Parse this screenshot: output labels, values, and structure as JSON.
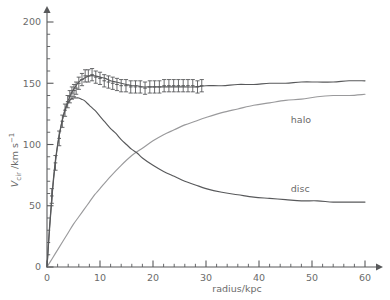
{
  "chart_data": {
    "type": "line",
    "title": "",
    "subtitle": "",
    "xlabel": "radius/kpc",
    "ylabel": "V_cir /km s^-1",
    "ylabel_parts": {
      "main": "V",
      "sub": "cir",
      "unit": " /km s",
      "sup": "−1"
    },
    "xlim": [
      0,
      62
    ],
    "ylim": [
      0,
      212
    ],
    "grid": false,
    "legend_position": "inline-annotations",
    "x_ticks_major": [
      0,
      10,
      20,
      30,
      40,
      50,
      60
    ],
    "x_ticks_major_labels": [
      "0",
      "10",
      "20",
      "30",
      "40",
      "50",
      "60"
    ],
    "x_tick_minor_step": 2,
    "y_ticks_major": [
      0,
      50,
      100,
      150,
      200
    ],
    "y_ticks_major_labels": [
      "0",
      "50",
      "100",
      "150",
      "200"
    ],
    "y_tick_minor_step": 10,
    "annotations": [
      {
        "text": "halo",
        "x": 46.0,
        "y": 120.0
      },
      {
        "text": "disc",
        "x": 46.0,
        "y": 64.0
      }
    ],
    "series": [
      {
        "name": "total",
        "kind": "line",
        "color": "#58595b",
        "x": [
          0,
          0.5,
          1,
          1.5,
          2,
          2.5,
          3,
          3.5,
          4,
          4.5,
          5,
          6,
          7,
          8,
          9,
          10,
          11,
          12,
          13,
          14,
          15,
          16,
          17,
          18,
          19,
          20,
          22,
          24,
          26,
          28,
          30,
          33,
          36,
          39,
          42,
          45,
          48,
          51,
          54,
          57,
          60
        ],
        "values": [
          0,
          34,
          62,
          84,
          100,
          112,
          122,
          130,
          136,
          141,
          145,
          151,
          154,
          156,
          156,
          155,
          154,
          152,
          151,
          150,
          149,
          148,
          148,
          147,
          147,
          147,
          147,
          147,
          147,
          147,
          148,
          148,
          149,
          149,
          150,
          150,
          151,
          151,
          151,
          152,
          152
        ]
      },
      {
        "name": "disc",
        "kind": "line",
        "color": "#58595b",
        "x": [
          0,
          0.5,
          1,
          1.5,
          2,
          2.5,
          3,
          3.5,
          4,
          4.5,
          5,
          5.5,
          6,
          6.5,
          7,
          8,
          9,
          10,
          11,
          12,
          13,
          14,
          15,
          16,
          17,
          18,
          20,
          22,
          24,
          26,
          28,
          30,
          33,
          36,
          39,
          42,
          45,
          48,
          51,
          54,
          57,
          60
        ],
        "values": [
          0,
          32,
          60,
          82,
          99,
          112,
          122,
          129,
          134,
          137,
          138,
          138,
          138,
          137,
          136,
          132,
          128,
          123,
          118,
          113,
          109,
          104,
          100,
          96,
          93,
          89,
          83,
          78,
          74,
          70,
          67,
          64,
          61,
          59,
          57,
          56,
          55,
          54,
          54,
          53,
          53,
          53
        ]
      },
      {
        "name": "halo",
        "kind": "line",
        "color": "#9a9a9c",
        "x": [
          0,
          1,
          2,
          3,
          4,
          5,
          6,
          7,
          8,
          9,
          10,
          12,
          14,
          16,
          18,
          20,
          22,
          24,
          26,
          28,
          30,
          33,
          36,
          39,
          42,
          45,
          48,
          51,
          54,
          57,
          60
        ],
        "values": [
          0,
          7,
          14,
          21,
          28,
          35,
          41,
          47,
          53,
          59,
          64,
          74,
          83,
          91,
          97,
          103,
          108,
          112,
          116,
          119,
          122,
          126,
          129,
          132,
          134,
          136,
          137,
          139,
          140,
          140,
          141
        ]
      },
      {
        "name": "observed",
        "kind": "scatter-errorbar",
        "color": "#58595b",
        "x": [
          0.9,
          1.6,
          2.3,
          2.9,
          3.4,
          3.9,
          4.3,
          4.7,
          5.1,
          5.5,
          6.0,
          6.6,
          7.2,
          7.8,
          8.5,
          9.2,
          10.0,
          10.8,
          11.6,
          12.4,
          13.2,
          14.0,
          14.9,
          15.8,
          16.7,
          17.6,
          18.5,
          19.4,
          20.3,
          21.2,
          22.1,
          23.0,
          23.9,
          24.8,
          25.7,
          26.6,
          27.5,
          28.4,
          29.2
        ],
        "values": [
          58,
          85,
          105,
          119,
          128,
          135,
          139,
          142,
          144,
          146,
          150,
          153,
          156,
          156,
          157,
          155,
          154,
          152,
          151,
          150,
          149,
          148,
          148,
          147,
          147,
          147,
          146,
          147,
          147,
          147,
          148,
          148,
          148,
          148,
          148,
          148,
          148,
          147,
          148
        ],
        "errors": [
          6,
          6,
          6,
          5,
          5,
          5,
          5,
          5,
          5,
          5,
          5,
          5,
          5,
          5,
          5,
          5,
          5,
          5,
          5,
          5,
          5,
          5,
          5,
          5,
          5,
          5,
          5,
          5,
          5,
          5,
          5,
          5,
          5,
          5,
          5,
          5,
          5,
          5,
          5
        ]
      }
    ]
  },
  "figure": {
    "background_color": "#ffffff",
    "axis_color": "#58595b",
    "text_color": "#6b6b6b",
    "total_curve_color": "#58595b",
    "disc_curve_color": "#58595b",
    "halo_curve_color": "#9a9a9c"
  }
}
